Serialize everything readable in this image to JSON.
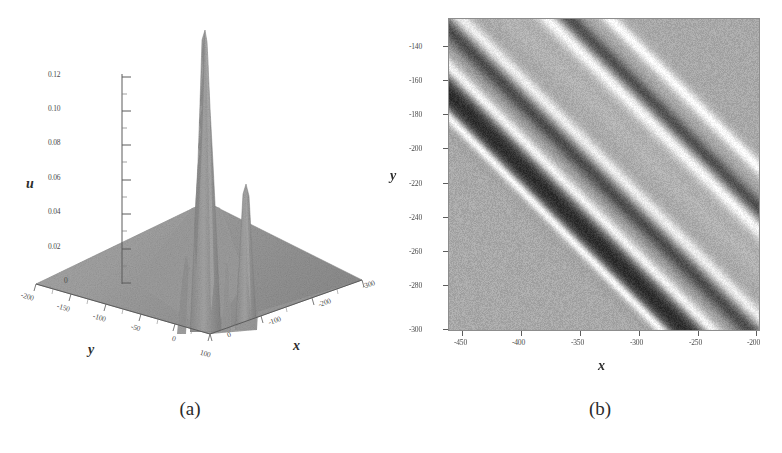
{
  "figure": {
    "panels": [
      {
        "id": "a",
        "caption": "(a)",
        "kind": "surface3d"
      },
      {
        "id": "b",
        "caption": "(b)",
        "kind": "heatmap"
      }
    ]
  },
  "chart_data": [
    {
      "type": "surface",
      "panel": "(a)",
      "title": "",
      "xlabel": "x",
      "ylabel": "y",
      "zlabel": "u",
      "grid": false,
      "legend": "none",
      "xlim": [
        -300,
        50
      ],
      "ylim": [
        -200,
        100
      ],
      "zlim": [
        0,
        0.13
      ],
      "xticks": [
        "-300",
        "-200",
        "-100",
        "0"
      ],
      "yticks": [
        "-200",
        "-150",
        "-100",
        "-50",
        "0",
        "100"
      ],
      "zticks": [
        "0.12",
        "0.10",
        "0.08",
        "0.06",
        "0.04",
        "0.02",
        "0"
      ],
      "ztick_values": [
        0.12,
        0.1,
        0.08,
        0.06,
        0.04,
        0.02,
        0
      ],
      "features": [
        {
          "name": "main-peak",
          "height": 0.132,
          "x": -30,
          "y": 60
        },
        {
          "name": "secondary-peak",
          "height": 0.066,
          "x": 5,
          "y": 85
        },
        {
          "name": "shoulder-ridge",
          "height": 0.038,
          "x": -55,
          "y": 55
        },
        {
          "name": "base-plane",
          "height": 0.0,
          "x": 0,
          "y": 0
        }
      ],
      "surface_color": "#9a9a9a"
    },
    {
      "type": "heatmap",
      "panel": "(b)",
      "title": "",
      "xlabel": "x",
      "ylabel": "y",
      "grid": false,
      "legend": "none",
      "xlim": [
        -462,
        -196
      ],
      "ylim": [
        -300,
        -128
      ],
      "xticks": [
        "-450",
        "-400",
        "-350",
        "-300",
        "-250",
        "-200"
      ],
      "xtick_values": [
        -450,
        -400,
        -350,
        -300,
        -250,
        -200
      ],
      "yticks": [
        "-140",
        "-160",
        "-180",
        "-200",
        "-220",
        "-240",
        "-260",
        "-280",
        "-300"
      ],
      "ytick_values": [
        -140,
        -160,
        -180,
        -200,
        -220,
        -240,
        -260,
        -280,
        -300
      ],
      "background_value": "#a9a9a9",
      "bands": [
        {
          "name": "dark-band-1",
          "offset": 118,
          "width": 12,
          "tone": "dark",
          "level": 0.18
        },
        {
          "name": "bright-edge-1a",
          "offset": 106,
          "width": 4,
          "tone": "bright",
          "level": 0.97
        },
        {
          "name": "bright-edge-1b",
          "offset": 132,
          "width": 5,
          "tone": "bright",
          "level": 0.95
        },
        {
          "name": "dark-band-2",
          "offset": 150,
          "width": 7,
          "tone": "dark",
          "level": 0.3
        },
        {
          "name": "bright-band-2",
          "offset": 162,
          "width": 5,
          "tone": "bright",
          "level": 0.93
        },
        {
          "name": "light-band-3",
          "offset": 186,
          "width": 9,
          "tone": "light",
          "level": 0.7
        },
        {
          "name": "bright-band-4",
          "offset": 205,
          "width": 6,
          "tone": "bright",
          "level": 0.98
        },
        {
          "name": "dark-band-5",
          "offset": 216,
          "width": 6,
          "tone": "dark",
          "level": 0.32
        },
        {
          "name": "bright-band-6",
          "offset": 236,
          "width": 5,
          "tone": "bright",
          "level": 0.99
        }
      ],
      "band_angle_deg": 45
    }
  ],
  "panel_a": {
    "axis_u_label": "u",
    "axis_x_label": "x",
    "axis_y_label": "y",
    "u_ticks": [
      "0.12",
      "0.10",
      "0.08",
      "0.06",
      "0.04",
      "0.02",
      "0"
    ],
    "y_ticks": [
      "-200",
      "-150",
      "-100",
      "-50",
      "0",
      "100"
    ],
    "x_ticks": [
      "0",
      "-100",
      "-200",
      "-300"
    ],
    "caption": "(a)"
  },
  "panel_b": {
    "axis_x_label": "x",
    "axis_y_label": "y",
    "y_ticks": [
      "-140",
      "-160",
      "-180",
      "-200",
      "-220",
      "-240",
      "-260",
      "-280",
      "-300"
    ],
    "x_ticks": [
      "-450",
      "-400",
      "-350",
      "-300",
      "-250",
      "-200"
    ],
    "caption": "(b)"
  },
  "colors": {
    "background": "#ffffff",
    "ink": "#3a3a3a",
    "surface_gray": "#9a9a9a",
    "density_gray": "#a9a9a9",
    "frame": "#8d8d8d"
  }
}
